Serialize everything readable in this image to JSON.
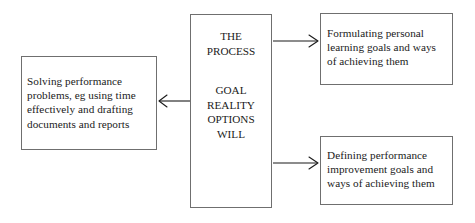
{
  "diagram": {
    "style": {
      "background": "#ffffff",
      "border_color": "#6f6f6f",
      "text_color": "#1a1a1a",
      "arrow_color": "#1a1a1a"
    },
    "center_box": {
      "heading_lines": [
        "THE",
        "PROCESS"
      ],
      "stage_lines": [
        "GOAL",
        "REALITY",
        "OPTIONS",
        "WILL"
      ]
    },
    "left_box": {
      "text": "Solving performance problems, eg using time effectively and drafting documents and reports"
    },
    "top_right_box": {
      "text": "Formulating personal learning goals and ways of achieving them"
    },
    "bottom_right_box": {
      "text": "Defining performance improvement goals and ways of achieving them"
    },
    "arrows": [
      {
        "name": "arrow-center-to-left",
        "direction": "left",
        "from": "center_box",
        "to": "left_box"
      },
      {
        "name": "arrow-center-to-top",
        "direction": "right",
        "from": "center_box",
        "to": "top_right_box"
      },
      {
        "name": "arrow-center-to-bottom",
        "direction": "right",
        "from": "center_box",
        "to": "bottom_right_box"
      }
    ]
  }
}
